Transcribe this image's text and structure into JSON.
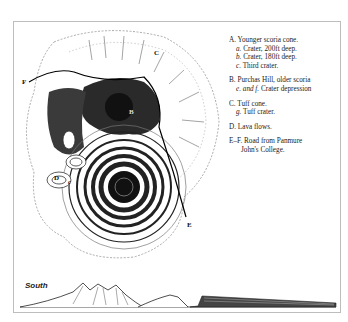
{
  "figure": {
    "map_labels": {
      "A": "A",
      "B": "B",
      "C": "C",
      "D": "D",
      "E": "E",
      "F": "F",
      "a": "a",
      "b": "b",
      "c": "c",
      "e": "e",
      "f": "f",
      "g": "g"
    },
    "legend": [
      {
        "key": "A.",
        "text": "Younger scoria cone.",
        "subs": [
          {
            "key": "a.",
            "text": "Crater, 200ft deep."
          },
          {
            "key": "b.",
            "text": "Crater, 180ft deep."
          },
          {
            "key": "c.",
            "text": "Third crater."
          }
        ]
      },
      {
        "key": "B.",
        "text": "Purchas Hill, older scoria",
        "subs": [
          {
            "key": "e. and f.",
            "text": "Crater depression"
          }
        ]
      },
      {
        "key": "C.",
        "text": "Tuff cone.",
        "subs": [
          {
            "key": "g.",
            "text": "Tuff crater."
          }
        ]
      },
      {
        "key": "D.",
        "text": "Lava flows.",
        "subs": []
      },
      {
        "key": "E–F.",
        "text": "Road from Panmure",
        "continuation": "John's College.",
        "subs": []
      }
    ],
    "profile_label": "South"
  }
}
